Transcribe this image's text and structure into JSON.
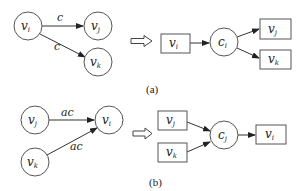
{
  "diagram": {
    "panel_a": {
      "caption": "(a)",
      "left_graph": {
        "nodes": [
          {
            "id": "vi",
            "base": "v",
            "sub": "i"
          },
          {
            "id": "vj",
            "base": "v",
            "sub": "j"
          },
          {
            "id": "vk",
            "base": "v",
            "sub": "k"
          }
        ],
        "edges": [
          {
            "from": "vi",
            "to": "vj",
            "label": "c"
          },
          {
            "from": "vi",
            "to": "vk",
            "label": "c"
          }
        ]
      },
      "right_graph": {
        "boxes": [
          {
            "id": "vi",
            "base": "v",
            "sub": "i"
          },
          {
            "id": "vj",
            "base": "v",
            "sub": "j"
          },
          {
            "id": "vk",
            "base": "v",
            "sub": "k"
          }
        ],
        "circle": {
          "id": "ci",
          "base": "c",
          "sub": "i"
        }
      }
    },
    "panel_b": {
      "caption": "(b)",
      "left_graph": {
        "nodes": [
          {
            "id": "vj",
            "base": "v",
            "sub": "j"
          },
          {
            "id": "vk",
            "base": "v",
            "sub": "k"
          },
          {
            "id": "vi",
            "base": "v",
            "sub": "i"
          }
        ],
        "edges": [
          {
            "from": "vj",
            "to": "vi",
            "label": "ac"
          },
          {
            "from": "vk",
            "to": "vi",
            "label": "ac"
          }
        ]
      },
      "right_graph": {
        "boxes": [
          {
            "id": "vj",
            "base": "v",
            "sub": "j"
          },
          {
            "id": "vk",
            "base": "v",
            "sub": "k"
          },
          {
            "id": "vi",
            "base": "v",
            "sub": "i"
          }
        ],
        "circle": {
          "id": "cj",
          "base": "c",
          "sub": "j"
        }
      }
    }
  }
}
